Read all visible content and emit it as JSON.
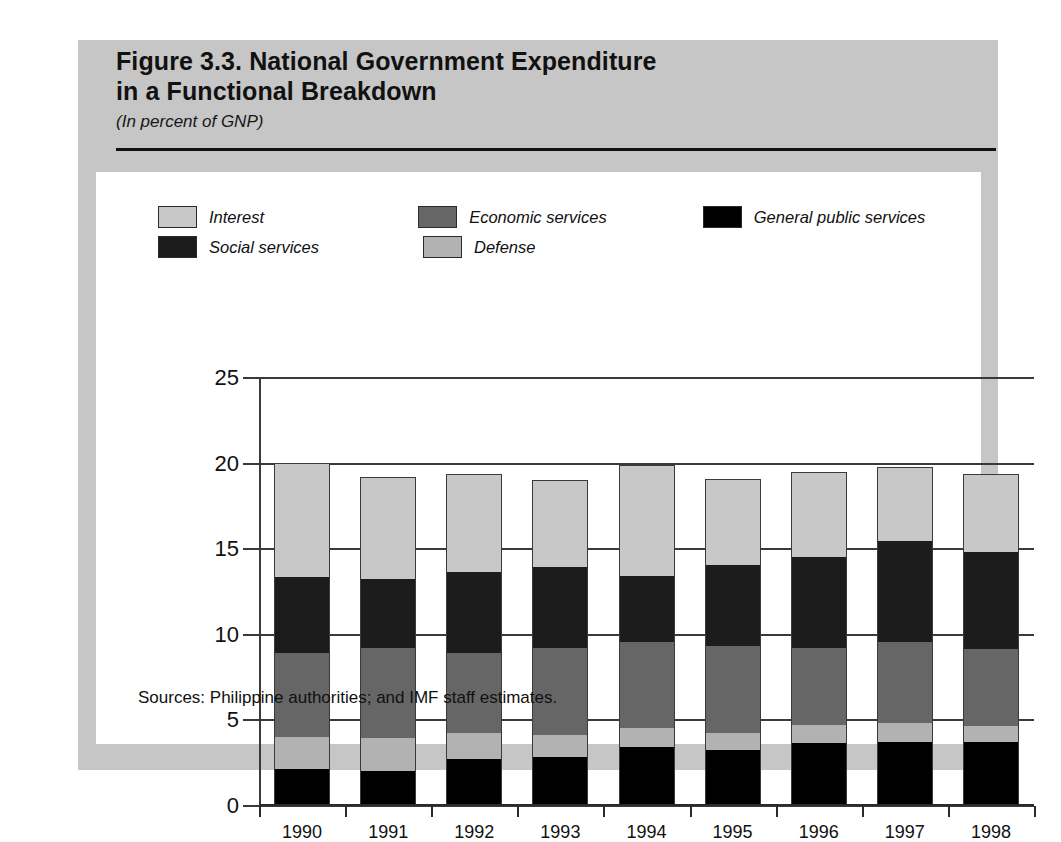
{
  "figure": {
    "title_line1": "Figure 3.3.  National Government Expenditure",
    "title_line2": "in a Functional Breakdown",
    "subtitle": "(In percent of GNP)",
    "source": "Sources:  Philippine authorities; and IMF staff estimates."
  },
  "colors": {
    "panel_background": "#c6c6c6",
    "card_background": "#ffffff",
    "interest": "#c8c8c8",
    "social_services": "#1c1c1c",
    "economic_services": "#666666",
    "defense": "#b2b2b2",
    "general_public_services": "#000000",
    "axis": "#3a3a3a",
    "text": "#111111"
  },
  "legend": {
    "rows": [
      [
        {
          "label": "Interest",
          "color_key": "interest"
        },
        {
          "label": "Economic services",
          "color_key": "economic_services"
        },
        {
          "label": "General public services",
          "color_key": "general_public_services"
        }
      ],
      [
        {
          "label": "Social services",
          "color_key": "social_services"
        },
        {
          "label": "Defense",
          "color_key": "defense"
        }
      ]
    ]
  },
  "chart_data": {
    "type": "bar",
    "stacked": true,
    "title": "Figure 3.3.  National Government Expenditure in a Functional Breakdown",
    "subtitle": "(In percent of GNP)",
    "xlabel": "",
    "ylabel": "",
    "ylim": [
      0,
      25
    ],
    "yticks": [
      0,
      5,
      10,
      15,
      20,
      25
    ],
    "ytick_labels": [
      "0",
      "5",
      "10",
      "15",
      "20",
      "25"
    ],
    "grid": true,
    "legend_position": "top-inside",
    "categories": [
      "1990",
      "1991",
      "1992",
      "1993",
      "1994",
      "1995",
      "1996",
      "1997",
      "1998"
    ],
    "stack_order_bottom_to_top": [
      "General public services",
      "Defense",
      "Economic services",
      "Social services",
      "Interest"
    ],
    "series": [
      {
        "name": "General public services",
        "color_key": "general_public_services",
        "values": [
          2.1,
          2.0,
          2.7,
          2.8,
          3.4,
          3.2,
          3.6,
          3.7,
          3.7
        ]
      },
      {
        "name": "Defense",
        "color_key": "defense",
        "values": [
          1.9,
          1.9,
          1.5,
          1.3,
          1.1,
          1.0,
          1.1,
          1.1,
          0.9
        ]
      },
      {
        "name": "Economic services",
        "color_key": "economic_services",
        "values": [
          4.9,
          5.3,
          4.7,
          5.1,
          5.0,
          5.1,
          4.5,
          4.7,
          4.5
        ]
      },
      {
        "name": "Social services",
        "color_key": "social_services",
        "values": [
          4.4,
          4.0,
          4.7,
          4.7,
          3.9,
          4.7,
          5.3,
          5.9,
          5.7
        ]
      },
      {
        "name": "Interest",
        "color_key": "interest",
        "values": [
          6.6,
          5.9,
          5.7,
          5.0,
          6.4,
          5.0,
          4.9,
          4.3,
          4.5
        ]
      }
    ],
    "totals": [
      19.9,
      19.1,
      19.3,
      18.9,
      19.8,
      19.0,
      19.4,
      19.7,
      19.3
    ]
  }
}
